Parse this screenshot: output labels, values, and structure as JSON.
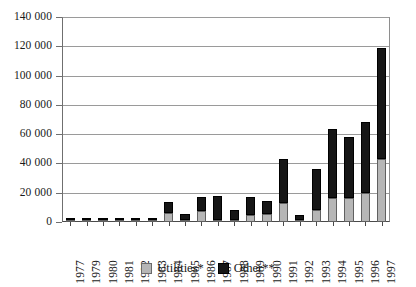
{
  "chart_data": {
    "type": "bar",
    "stacked": true,
    "title": "",
    "subtitle": "",
    "xlabel": "",
    "ylabel": "",
    "ylim": [
      0,
      140000
    ],
    "ytick_step": 20000,
    "ytick_labels": [
      "140 000",
      "120 000",
      "100 000",
      "80 000",
      "60 000",
      "40 000",
      "20 000",
      "0"
    ],
    "ytick_values": [
      140000,
      120000,
      100000,
      80000,
      60000,
      40000,
      20000,
      0
    ],
    "grid": true,
    "legend_position": "bottom-center",
    "categories": [
      "1977",
      "1979",
      "1980",
      "1981",
      "1982",
      "1983",
      "1984",
      "1985",
      "1986",
      "1987",
      "1988",
      "1989",
      "1990",
      "1991",
      "1992",
      "1993",
      "1994",
      "1995",
      "1996",
      "1997"
    ],
    "series": [
      {
        "name": "Utilities*",
        "color": "#b6b6b6",
        "values": [
          600,
          300,
          200,
          500,
          400,
          1300,
          6000,
          600,
          7600,
          900,
          300,
          4800,
          5400,
          12800,
          600,
          8200,
          16300,
          16600,
          19900,
          43000
        ]
      },
      {
        "name": "Other**",
        "color": "#161616",
        "values": [
          500,
          400,
          200,
          400,
          400,
          900,
          7500,
          4300,
          9800,
          16600,
          6900,
          12300,
          9000,
          30400,
          3700,
          27800,
          46900,
          41200,
          48300,
          76000
        ]
      }
    ],
    "totals": [
      1100,
      700,
      400,
      900,
      800,
      2200,
      13500,
      4900,
      17400,
      17500,
      7200,
      17100,
      14400,
      43200,
      4300,
      36000,
      63200,
      57800,
      68200,
      119000
    ]
  },
  "legend": {
    "entries": [
      {
        "label": "Utilities*",
        "swatch": "legend-swatch-utilities"
      },
      {
        "label": "Other**",
        "swatch": "legend-swatch-other"
      }
    ]
  }
}
